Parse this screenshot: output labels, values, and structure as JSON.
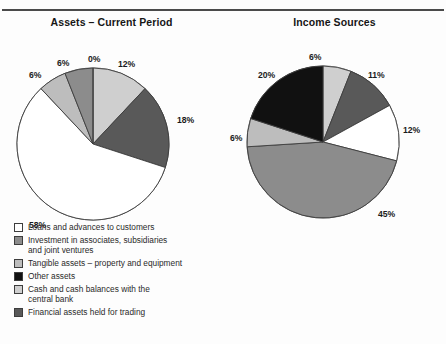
{
  "colors": {
    "white": "#ffffff",
    "light_gray": "#cfcfcf",
    "pale_gray": "#bdbdbd",
    "mid_gray": "#8c8c8c",
    "dark_gray": "#595959",
    "darker_gray": "#4a4a4a",
    "black": "#111111",
    "outline": "#3d3d3d",
    "rule": "#4a4a4a",
    "text": "#1b1b1b"
  },
  "charts": [
    {
      "id": "assets-current-period",
      "title": "Assets – Current Period",
      "chart_data": {
        "type": "pie",
        "title": "Assets – Current Period",
        "labels": [
          "Cash and cash balances with the central bank",
          "Financial assets held for trading",
          "Loans and advances to customers",
          "Tangible assets – property and equipment",
          "Investment in associates, subsidiaries and joint ventures",
          "Other assets"
        ],
        "values": [
          12,
          18,
          58,
          6,
          6,
          0
        ],
        "value_labels": [
          "12%",
          "18%",
          "58%",
          "6%",
          "6%",
          "0%"
        ],
        "colors": [
          "#cfcfcf",
          "#595959",
          "#ffffff",
          "#bdbdbd",
          "#8c8c8c",
          "#111111"
        ],
        "start_angle_deg": 0,
        "direction": "clockwise",
        "legend_position": "below"
      },
      "pct_labels": [
        {
          "text": "12%",
          "x": 118,
          "y": 27
        },
        {
          "text": "18%",
          "x": 177,
          "y": 83
        },
        {
          "text": "58%",
          "x": 29,
          "y": 188
        },
        {
          "text": "6%",
          "x": 57,
          "y": 26
        },
        {
          "text": "6%",
          "x": 29,
          "y": 38
        },
        {
          "text": "0%",
          "x": 88,
          "y": 22
        }
      ],
      "legend": [
        {
          "label": "Loans and advances to customers",
          "color": "#ffffff"
        },
        {
          "label": "Investment in associates, subsidiaries\nand joint ventures",
          "color": "#8c8c8c"
        },
        {
          "label": "Tangible assets – property and equipment",
          "color": "#bdbdbd"
        },
        {
          "label": "Other assets",
          "color": "#111111"
        },
        {
          "label": "Cash and cash balances with the\ncentral bank",
          "color": "#cfcfcf"
        },
        {
          "label": "Financial assets held for trading",
          "color": "#595959"
        }
      ]
    },
    {
      "id": "income-sources",
      "title": "Income Sources",
      "chart_data": {
        "type": "pie",
        "title": "Income Sources",
        "labels": [
          "Net interest income",
          "Gains on financial assets & liabilities held for trading",
          "Fee and commission income",
          "Dividend income",
          "Exchange differences, net",
          "Other operating income"
        ],
        "values": [
          6,
          11,
          12,
          45,
          6,
          20
        ],
        "value_labels": [
          "6%",
          "11%",
          "12%",
          "45%",
          "6%",
          "20%"
        ],
        "colors": [
          "#cfcfcf",
          "#595959",
          "#ffffff",
          "#8c8c8c",
          "#bdbdbd",
          "#111111"
        ],
        "start_angle_deg": 0,
        "direction": "clockwise",
        "legend_position": "below"
      },
      "pct_labels": [
        {
          "text": "6%",
          "x": 86,
          "y": 20
        },
        {
          "text": "11%",
          "x": 145,
          "y": 38
        },
        {
          "text": "12%",
          "x": 180,
          "y": 93
        },
        {
          "text": "45%",
          "x": 155,
          "y": 177
        },
        {
          "text": "6%",
          "x": 7,
          "y": 101
        },
        {
          "text": "20%",
          "x": 35,
          "y": 38
        }
      ],
      "legend": [
        {
          "label": "Gains on financial assets & liabilities\nheld for trading",
          "color": "#595959"
        },
        {
          "label": "Exchange differences, net",
          "color": "#bdbdbd"
        },
        {
          "label": "Other operating income",
          "color": "#111111"
        },
        {
          "label": "Net interest income",
          "color": "#cfcfcf"
        },
        {
          "label": "Dividend income",
          "color": "#595959"
        },
        {
          "label": "Fee and commission income",
          "color": "#ffffff"
        }
      ]
    }
  ]
}
